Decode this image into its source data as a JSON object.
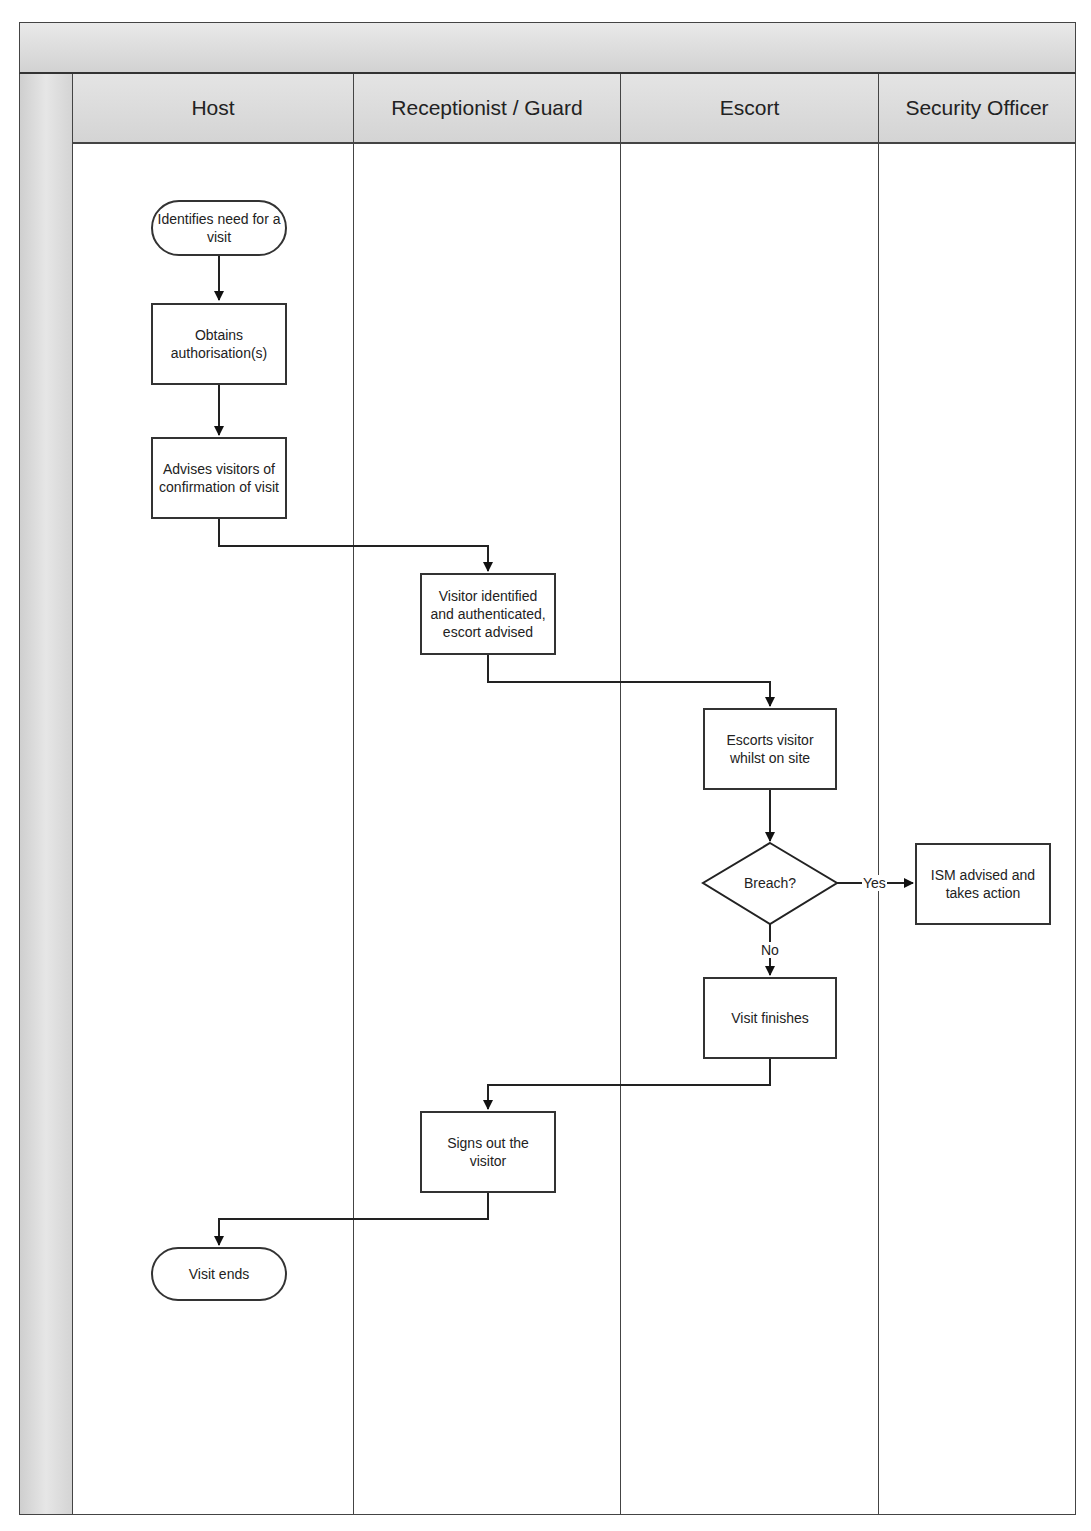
{
  "diagram": {
    "type": "swimlane-flowchart",
    "title": "",
    "lanes": [
      {
        "id": "host",
        "label": "Host"
      },
      {
        "id": "receptionist",
        "label": "Receptionist / Guard"
      },
      {
        "id": "escort",
        "label": "Escort"
      },
      {
        "id": "security",
        "label": "Security Officer"
      }
    ],
    "nodes": {
      "start": {
        "label": "Identifies need for a visit",
        "shape": "terminal",
        "lane": "host"
      },
      "obtain": {
        "label": "Obtains authorisation(s)",
        "shape": "process",
        "lane": "host"
      },
      "advise": {
        "label": "Advises visitors of confirmation of visit",
        "shape": "process",
        "lane": "host"
      },
      "identify": {
        "label": "Visitor identified and authenticated, escort advised",
        "shape": "process",
        "lane": "receptionist"
      },
      "escorts": {
        "label": "Escorts visitor whilst on site",
        "shape": "process",
        "lane": "escort"
      },
      "breach": {
        "label": "Breach?",
        "shape": "decision",
        "lane": "escort"
      },
      "ism": {
        "label": "ISM advised and takes action",
        "shape": "process",
        "lane": "security"
      },
      "finish": {
        "label": "Visit finishes",
        "shape": "process",
        "lane": "escort"
      },
      "signout": {
        "label": "Signs out the visitor",
        "shape": "process",
        "lane": "receptionist"
      },
      "end": {
        "label": "Visit ends",
        "shape": "terminal",
        "lane": "host"
      }
    },
    "edges": [
      {
        "from": "start",
        "to": "obtain",
        "label": ""
      },
      {
        "from": "obtain",
        "to": "advise",
        "label": ""
      },
      {
        "from": "advise",
        "to": "identify",
        "label": ""
      },
      {
        "from": "identify",
        "to": "escorts",
        "label": ""
      },
      {
        "from": "escorts",
        "to": "breach",
        "label": ""
      },
      {
        "from": "breach",
        "to": "ism",
        "label": "Yes"
      },
      {
        "from": "breach",
        "to": "finish",
        "label": "No"
      },
      {
        "from": "finish",
        "to": "signout",
        "label": ""
      },
      {
        "from": "signout",
        "to": "end",
        "label": ""
      }
    ],
    "edge_labels": {
      "yes": "Yes",
      "no": "No"
    }
  }
}
